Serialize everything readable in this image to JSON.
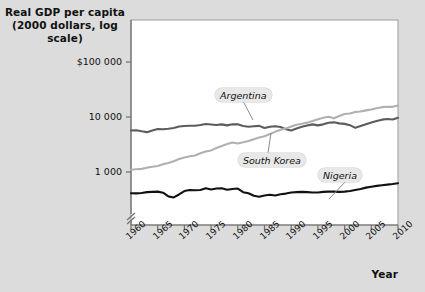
{
  "figure": {
    "background_color": "#dcdcdc",
    "plot_background_color": "#ffffff",
    "y_axis_title": "Real GDP per capita (2000 dollars, log scale)",
    "y_axis_title_line1": "Real GDP per capita",
    "y_axis_title_line2": "(2000 dollars, log scale)",
    "x_axis_title": "Year"
  },
  "chart_data": {
    "type": "line",
    "title": "Real GDP per capita (2000 dollars, log scale)",
    "xlabel": "Year",
    "ylabel": "Real GDP per capita (2000 dollars, log scale)",
    "yscale": "log",
    "ylim": [
      300,
      300000
    ],
    "xlim": [
      1960,
      2010
    ],
    "grid": false,
    "legend": "inline-labels",
    "axis_break": true,
    "ytick_labels": [
      "$100 000",
      "10 000",
      "1 000"
    ],
    "ytick_values": [
      100000,
      10000,
      1000
    ],
    "xtick_labels": [
      "1960",
      "1965",
      "1970",
      "1975",
      "1980",
      "1985",
      "1990",
      "1995",
      "2000",
      "2005",
      "2010"
    ],
    "xtick_values": [
      1960,
      1965,
      1970,
      1975,
      1980,
      1985,
      1990,
      1995,
      2000,
      2005,
      2010
    ],
    "x": [
      1960,
      1961,
      1962,
      1963,
      1964,
      1965,
      1966,
      1967,
      1968,
      1969,
      1970,
      1971,
      1972,
      1973,
      1974,
      1975,
      1976,
      1977,
      1978,
      1979,
      1980,
      1981,
      1982,
      1983,
      1984,
      1985,
      1986,
      1987,
      1988,
      1989,
      1990,
      1991,
      1992,
      1993,
      1994,
      1995,
      1996,
      1997,
      1998,
      1999,
      2000,
      2001,
      2002,
      2003,
      2004,
      2005,
      2006,
      2007,
      2008,
      2009,
      2010
    ],
    "series": [
      {
        "name": "Argentina",
        "color": "#5c5c5c",
        "label_color": "#111111",
        "values": [
          5700,
          5750,
          5500,
          5300,
          5700,
          6050,
          6000,
          6100,
          6300,
          6700,
          6850,
          6950,
          6950,
          7150,
          7450,
          7300,
          7150,
          7350,
          7050,
          7400,
          7350,
          6850,
          6650,
          6800,
          6900,
          6300,
          6650,
          6800,
          6600,
          6000,
          5700,
          6200,
          6650,
          7000,
          7350,
          7050,
          7350,
          7850,
          8000,
          7650,
          7500,
          7100,
          6350,
          6850,
          7400,
          7950,
          8450,
          8950,
          9200,
          9000,
          9700
        ]
      },
      {
        "name": "South Korea",
        "color": "#b0b0b0",
        "label_color": "#111111",
        "values": [
          1100,
          1120,
          1140,
          1200,
          1250,
          1290,
          1390,
          1460,
          1570,
          1720,
          1830,
          1930,
          2000,
          2200,
          2350,
          2470,
          2730,
          2970,
          3230,
          3430,
          3300,
          3470,
          3670,
          3950,
          4230,
          4450,
          4890,
          5370,
          5860,
          6200,
          6690,
          7250,
          7530,
          7900,
          8480,
          9100,
          9660,
          10100,
          9500,
          10400,
          11300,
          11600,
          12300,
          12600,
          13200,
          13700,
          14400,
          15100,
          15400,
          15300,
          16200
        ]
      },
      {
        "name": "Nigeria",
        "color": "#111111",
        "label_color": "#111111",
        "values": [
          410,
          408,
          415,
          430,
          435,
          440,
          420,
          360,
          345,
          390,
          450,
          470,
          465,
          470,
          505,
          480,
          500,
          505,
          475,
          490,
          500,
          430,
          410,
          370,
          355,
          375,
          385,
          375,
          395,
          405,
          425,
          430,
          435,
          430,
          425,
          425,
          435,
          440,
          440,
          435,
          440,
          450,
          470,
          490,
          520,
          540,
          560,
          575,
          590,
          605,
          625
        ]
      }
    ],
    "annotations": [
      {
        "text": "Argentina",
        "series": "Argentina",
        "x": 1976,
        "label_x": 215,
        "label_y": 88,
        "leader_to_x": 253,
        "leader_to_y": 120
      },
      {
        "text": "South Korea",
        "series": "South Korea",
        "x": 1987,
        "label_x": 238,
        "label_y": 153,
        "leader_to_x": 271,
        "leader_to_y": 133
      },
      {
        "text": "Nigeria",
        "series": "Nigeria",
        "x": 1997,
        "label_x": 318,
        "label_y": 168,
        "leader_to_x": 329,
        "leader_to_y": 199
      }
    ]
  }
}
